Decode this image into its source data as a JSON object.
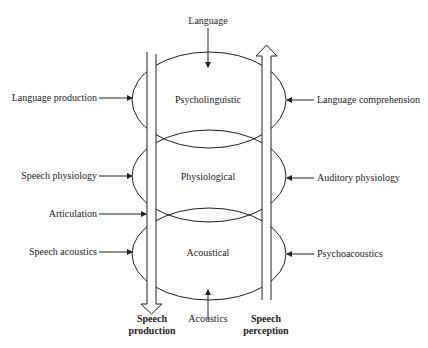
{
  "diagram": {
    "top_label": "Language",
    "bottom_label": "Acoustics",
    "levels": [
      {
        "name": "Psycholinguistic",
        "left": "Language production",
        "right": "Language comprehension"
      },
      {
        "name": "Physiological",
        "left": "Speech physiology",
        "right": "Auditory physiology"
      },
      {
        "name": "Acoustical",
        "left": "Speech acoustics",
        "right": "Psychoacoustics"
      }
    ],
    "articulation_label": "Articulation",
    "production_arrow": {
      "line1": "Speech",
      "line2": "production"
    },
    "perception_arrow": {
      "line1": "Speech",
      "line2": "perception"
    }
  }
}
